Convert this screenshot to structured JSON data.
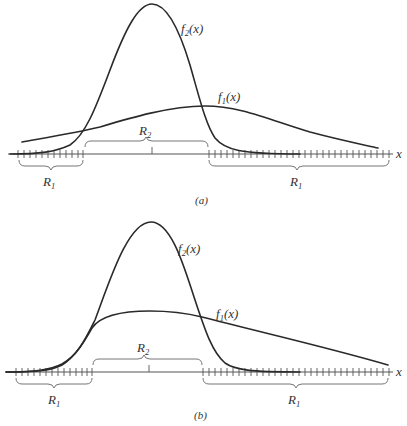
{
  "figure": {
    "panels": [
      {
        "id": "a",
        "caption": "(a)",
        "axis_label": "x",
        "curves": [
          {
            "name": "f_2(x)",
            "label_base": "f",
            "label_sub": "2",
            "label_arg": "(x)",
            "shape": "narrow tall unimodal (normal-like)"
          },
          {
            "name": "f_1(x)",
            "label_base": "f",
            "label_sub": "1",
            "label_arg": "(x)",
            "shape": "wide low unimodal"
          }
        ],
        "regions": [
          {
            "label_base": "R",
            "label_sub": "1",
            "span": "left tail, x below first crossing"
          },
          {
            "label_base": "R",
            "label_sub": "2",
            "span": "between crossings"
          },
          {
            "label_base": "R",
            "label_sub": "1",
            "span": "right tail, x above second crossing"
          }
        ]
      },
      {
        "id": "b",
        "caption": "(b)",
        "axis_label": "x",
        "curves": [
          {
            "name": "f_2(x)",
            "label_base": "f",
            "label_sub": "2",
            "label_arg": "(x)",
            "shape": "narrow tall unimodal (normal-like)"
          },
          {
            "name": "f_1(x)",
            "label_base": "f",
            "label_sub": "1",
            "label_arg": "(x)",
            "shape": "plateau with long right tail, left tail coincides with f_2"
          }
        ],
        "regions": [
          {
            "label_base": "R",
            "label_sub": "1",
            "span": "left tail"
          },
          {
            "label_base": "R",
            "label_sub": "2",
            "span": "between crossings"
          },
          {
            "label_base": "R",
            "label_sub": "1",
            "span": "right tail"
          }
        ]
      }
    ]
  }
}
